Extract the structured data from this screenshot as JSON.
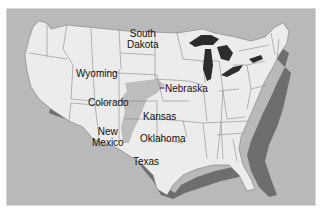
{
  "map": {
    "title": "",
    "region": "Contiguous United States",
    "colors": {
      "ocean": "#b9b9b9",
      "land": "#ececec",
      "state_border": "#8a8a8a",
      "highlight_region": "#bdbdbd",
      "great_lakes": "#2c2c2c",
      "coastal_shading": "#6e6e6e"
    },
    "labels": [
      {
        "id": "wyoming",
        "text": "Wyoming"
      },
      {
        "id": "south-dakota",
        "line1": "South",
        "line2": "Dakota"
      },
      {
        "id": "nebraska",
        "text": "Nebraska"
      },
      {
        "id": "colorado",
        "text": "Colorado"
      },
      {
        "id": "kansas",
        "text": "Kansas"
      },
      {
        "id": "new-mexico",
        "line1": "New",
        "line2": "Mexico"
      },
      {
        "id": "oklahoma",
        "text": "Oklahoma"
      },
      {
        "id": "texas",
        "text": "Texas"
      }
    ]
  }
}
